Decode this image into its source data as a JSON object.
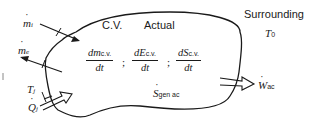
{
  "diagram": {
    "cv_label": "C.V.",
    "actual_label": "Actual",
    "surrounding_label": "Surrounding",
    "surrounding_temp": {
      "symbol": "T",
      "sub": "0"
    },
    "inlet_mass_flow": {
      "symbol": "m",
      "sub": "i"
    },
    "exit_mass_flow": {
      "symbol": "m",
      "sub": "e"
    },
    "boundary_temp": {
      "symbol": "T",
      "sub": "j"
    },
    "heat_transfer": {
      "symbol": "Q",
      "sub": "j"
    },
    "work_rate": {
      "symbol": "W",
      "sub": "ac"
    },
    "entropy_generation": {
      "symbol": "S",
      "sub": "gen ac"
    },
    "rates": [
      {
        "num_sym": "dm",
        "num_sub": "c.v.",
        "den": "dt",
        "sep": ";"
      },
      {
        "num_sym": "dE",
        "num_sub": "c.v.",
        "den": "dt",
        "sep": ";"
      },
      {
        "num_sym": "dS",
        "num_sub": "c.v.",
        "den": "dt",
        "sep": ""
      }
    ],
    "colors": {
      "stroke": "#1a1a1a",
      "background": "#ffffff"
    }
  }
}
